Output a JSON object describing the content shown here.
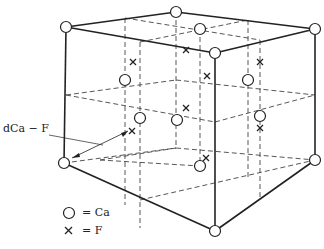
{
  "diagram": {
    "distance_label": "dCa − F",
    "legend": [
      {
        "symbol": "circle",
        "label": "= Ca"
      },
      {
        "symbol": "cross",
        "label": "= F"
      }
    ],
    "colors": {
      "line": "#222222",
      "background": "#ffffff"
    }
  }
}
